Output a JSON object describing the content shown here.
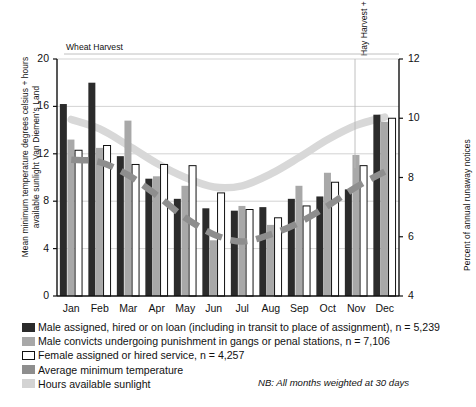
{
  "axes": {
    "y_left_title": "Mean minimum temperature degrees celsius + hours available sunlight Van Diemen's Land",
    "y_right_title": "Percent of annual runaway notices",
    "y_left_ticks": [
      "0",
      "4",
      "8",
      "12",
      "16",
      "20"
    ],
    "y_right_ticks": [
      "4",
      "6",
      "8",
      "10",
      "12"
    ]
  },
  "annotations": {
    "wheat_harvest": "Wheat Harvest",
    "hay_harvest": "Hay Harvest + Shearing",
    "note": "NB: All months weighted at 30 days"
  },
  "legend": [
    {
      "swatch": "sw-dark",
      "label": "Male assigned, hired or on loan (including in transit to place of assignment), n = 5,239"
    },
    {
      "swatch": "sw-mid",
      "label": "Male convicts undergoing punishment in gangs or penal stations, n = 7,106"
    },
    {
      "swatch": "sw-white",
      "label": "Female assigned or hired service, n = 4,257"
    },
    {
      "swatch": "sw-temp",
      "label": "Average minimum temperature"
    },
    {
      "swatch": "sw-sun",
      "label": "Hours available sunlight"
    }
  ],
  "colors": {
    "dark_bar": "#2b2b2b",
    "mid_bar": "#a8a8a8",
    "white_bar": "#ffffff",
    "temperature_line": "#8e8e8e",
    "sunlight_line": "#d8d8d8",
    "gridline": "#c8c8c8",
    "axis": "#111111"
  },
  "chart_data": {
    "type": "bar",
    "title": "",
    "xlabel": "",
    "ylabel": "Mean minimum temperature degrees celsius + hours available sunlight Van Diemen's Land",
    "ylabel_right": "Percent of annual runaway notices",
    "categories": [
      "Jan",
      "Feb",
      "Mar",
      "Apr",
      "May",
      "Jun",
      "Jul",
      "Aug",
      "Sep",
      "Oct",
      "Nov",
      "Dec"
    ],
    "ylim": [
      0,
      20
    ],
    "ylim_right": [
      4,
      12
    ],
    "grid": true,
    "legend_position": "below",
    "series": [
      {
        "name": "Male assigned, hired or on loan (including in transit to place of assignment), n = 5,239",
        "kind": "bar",
        "axis": "right",
        "values": [
          16.2,
          18.0,
          11.8,
          9.9,
          8.2,
          7.4,
          7.2,
          7.5,
          8.2,
          8.4,
          9.0,
          15.3
        ],
        "values_right": [
          9.0,
          9.6,
          7.4,
          6.6,
          6.1,
          5.8,
          5.7,
          5.8,
          6.1,
          6.2,
          6.4,
          8.6
        ]
      },
      {
        "name": "Male convicts undergoing punishment in gangs or penal stations, n = 7,106",
        "kind": "bar",
        "axis": "right",
        "values": [
          13.2,
          12.5,
          14.8,
          10.1,
          9.3,
          4.7,
          7.6,
          6.0,
          9.3,
          10.4,
          11.9,
          14.7
        ],
        "values_right": [
          8.0,
          7.8,
          8.6,
          7.1,
          6.8,
          5.2,
          6.2,
          5.6,
          6.8,
          7.2,
          7.6,
          8.5
        ]
      },
      {
        "name": "Female assigned or hired service, n = 4,257",
        "kind": "bar",
        "axis": "right",
        "values": [
          12.3,
          12.7,
          11.1,
          11.1,
          11.0,
          8.7,
          7.3,
          6.6,
          7.6,
          9.6,
          11.0,
          15.0
        ],
        "values_right": [
          7.7,
          7.9,
          7.4,
          7.4,
          7.4,
          6.5,
          6.1,
          5.9,
          6.2,
          7.0,
          7.4,
          8.6
        ]
      },
      {
        "name": "Average minimum temperature",
        "kind": "line",
        "axis": "left",
        "values": [
          11.5,
          11.3,
          10.2,
          8.5,
          6.6,
          5.2,
          4.6,
          5.2,
          6.2,
          7.6,
          9.2,
          10.5
        ]
      },
      {
        "name": "Hours available sunlight",
        "kind": "line",
        "axis": "left",
        "values": [
          14.9,
          14.1,
          12.7,
          11.2,
          10.0,
          9.2,
          9.3,
          10.3,
          11.7,
          13.2,
          14.4,
          15.1
        ]
      }
    ]
  }
}
